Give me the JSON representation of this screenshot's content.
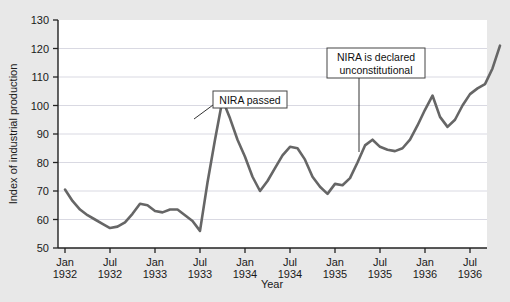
{
  "figure": {
    "background_color": "#e8e8e8",
    "plot_background_color": "#ffffff",
    "line_color": "#666666",
    "grid_color": "#d9d9e2",
    "axis_color": "#222222",
    "bleed_text": " "
  },
  "chart_data": {
    "type": "line",
    "title": "",
    "xlabel": "Year",
    "ylabel": "Index of industrial production",
    "ylim": [
      50,
      130
    ],
    "yticks": [
      50,
      60,
      70,
      80,
      90,
      100,
      110,
      120,
      130
    ],
    "grid": true,
    "legend": "none",
    "xtick_labels": [
      {
        "month": "Jan",
        "year": "1932"
      },
      {
        "month": "Jul",
        "year": "1932"
      },
      {
        "month": "Jan",
        "year": "1933"
      },
      {
        "month": "Jul",
        "year": "1933"
      },
      {
        "month": "Jan",
        "year": "1934"
      },
      {
        "month": "Jul",
        "year": "1934"
      },
      {
        "month": "Jan",
        "year": "1935"
      },
      {
        "month": "Jul",
        "year": "1935"
      },
      {
        "month": "Jan",
        "year": "1936"
      },
      {
        "month": "Jul",
        "year": "1936"
      }
    ],
    "x": [
      "Jan 1932",
      "Feb 1932",
      "Mar 1932",
      "Apr 1932",
      "May 1932",
      "Jun 1932",
      "Jul 1932",
      "Aug 1932",
      "Sep 1932",
      "Oct 1932",
      "Nov 1932",
      "Dec 1932",
      "Jan 1933",
      "Feb 1933",
      "Mar 1933",
      "Apr 1933",
      "May 1933",
      "Jun 1933",
      "Jul 1933",
      "Aug 1933",
      "Sep 1933",
      "Oct 1933",
      "Nov 1933",
      "Dec 1933",
      "Jan 1934",
      "Feb 1934",
      "Mar 1934",
      "Apr 1934",
      "May 1934",
      "Jun 1934",
      "Jul 1934",
      "Aug 1934",
      "Sep 1934",
      "Oct 1934",
      "Nov 1934",
      "Dec 1934",
      "Jan 1935",
      "Feb 1935",
      "Mar 1935",
      "Apr 1935",
      "May 1935",
      "Jun 1935",
      "Jul 1935",
      "Aug 1935",
      "Sep 1935",
      "Oct 1935",
      "Nov 1935",
      "Dec 1935",
      "Jan 1936",
      "Feb 1936",
      "Mar 1936",
      "Apr 1936",
      "May 1936",
      "Jun 1936",
      "Jul 1936",
      "Aug 1936",
      "Sep 1936",
      "Oct 1936",
      "Nov 1936"
    ],
    "values": [
      70.5,
      66.5,
      63.5,
      61.5,
      60.0,
      58.5,
      57.0,
      57.5,
      59.0,
      62.0,
      65.5,
      65.0,
      63.0,
      62.5,
      63.5,
      63.5,
      61.5,
      59.5,
      56.0,
      73.0,
      88.0,
      102.0,
      95.5,
      88.0,
      82.0,
      75.0,
      70.0,
      73.5,
      78.0,
      82.5,
      85.5,
      85.0,
      81.0,
      75.0,
      71.5,
      69.0,
      72.5,
      72.0,
      74.5,
      80.0,
      86.0,
      88.0,
      85.5,
      84.5,
      84.0,
      85.0,
      88.0,
      93.0,
      98.5,
      103.5,
      96.0,
      92.5,
      95.0,
      100.0,
      104.0,
      106.0,
      107.5,
      113.0,
      121.0
    ],
    "annotations": [
      {
        "id": "nira-passed",
        "text_lines": [
          "NIRA passed"
        ],
        "box_x": 213,
        "box_y": 91,
        "box_w": 74,
        "box_h": 17,
        "leader": [
          [
            213,
            105
          ],
          [
            194,
            119
          ]
        ]
      },
      {
        "id": "nira-unconstitutional",
        "text_lines": [
          "NIRA is declared",
          "unconstitutional"
        ],
        "box_x": 327,
        "box_y": 48,
        "box_w": 98,
        "box_h": 30,
        "leader": [
          [
            359,
            78
          ],
          [
            359,
            152
          ]
        ]
      }
    ]
  }
}
